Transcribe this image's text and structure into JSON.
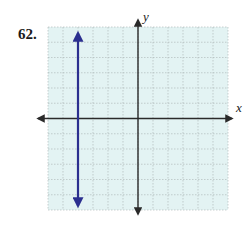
{
  "problem": {
    "number": "62."
  },
  "chart_data": {
    "type": "line",
    "title": "",
    "xlabel": "x",
    "ylabel": "y",
    "xlim": [
      -6,
      6
    ],
    "ylim": [
      -6,
      6
    ],
    "grid": true,
    "grid_step": 1,
    "series": [
      {
        "name": "vertical line",
        "equation": "x = -4",
        "x": [
          -4,
          -4
        ],
        "y": [
          -6,
          6
        ],
        "color": "#2b2f8f",
        "arrows": "both"
      }
    ]
  },
  "colors": {
    "grid_background": "#e3f3f3",
    "grid_lines": "#a9b4b4",
    "axes": "#2a2a2a",
    "line": "#2b2f8f"
  }
}
